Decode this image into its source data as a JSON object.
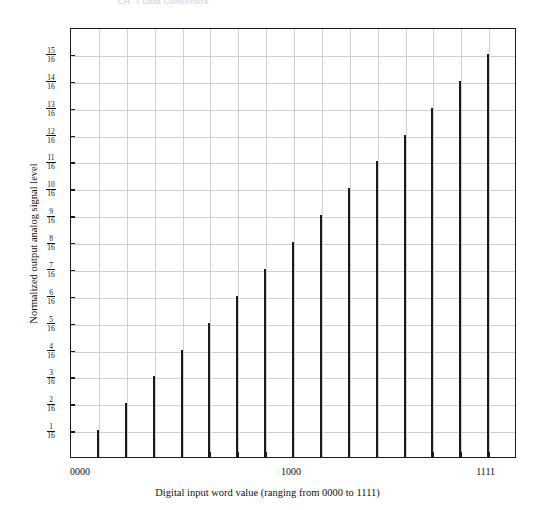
{
  "page": {
    "running_header": "CH.  7  Data Converters"
  },
  "chart_data": {
    "type": "bar",
    "title": "",
    "xlabel": "Digital input word value (ranging from 0000 to 1111)",
    "ylabel": "Normalized output analog signal level",
    "categories": [
      "0001",
      "0010",
      "0011",
      "0100",
      "0101",
      "0110",
      "0111",
      "1000",
      "1001",
      "1010",
      "1011",
      "1100",
      "1101",
      "1110",
      "1111"
    ],
    "values": [
      1,
      2,
      3,
      4,
      5,
      6,
      7,
      8,
      9,
      10,
      11,
      12,
      13,
      14,
      15
    ],
    "value_labels": [
      "1/16",
      "2/16",
      "3/16",
      "4/16",
      "5/16",
      "6/16",
      "7/16",
      "8/16",
      "9/16",
      "10/16",
      "11/16",
      "12/16",
      "13/16",
      "14/16",
      "15/16"
    ],
    "ylim": [
      0,
      16
    ],
    "ytick_values": [
      1,
      2,
      3,
      4,
      5,
      6,
      7,
      8,
      9,
      10,
      11,
      12,
      13,
      14,
      15
    ],
    "ytick_labels": [
      {
        "num": "1",
        "den": "16"
      },
      {
        "num": "2",
        "den": "16"
      },
      {
        "num": "3",
        "den": "16"
      },
      {
        "num": "4",
        "den": "16"
      },
      {
        "num": "5",
        "den": "16"
      },
      {
        "num": "6",
        "den": "16"
      },
      {
        "num": "7",
        "den": "16"
      },
      {
        "num": "8",
        "den": "16"
      },
      {
        "num": "9",
        "den": "16"
      },
      {
        "num": "10",
        "den": "16"
      },
      {
        "num": "11",
        "den": "16"
      },
      {
        "num": "12",
        "den": "16"
      },
      {
        "num": "13",
        "den": "16"
      },
      {
        "num": "14",
        "den": "16"
      },
      {
        "num": "15",
        "den": "16"
      }
    ],
    "xtick_labels": [
      {
        "label": "0000",
        "index": 0
      },
      {
        "label": "1000",
        "index": 8
      },
      {
        "label": "1111",
        "index": 15
      }
    ],
    "grid": true,
    "legend": null,
    "bar_color": "#1a1a1a",
    "grid_color": "#cfcfcf",
    "axis_color": "#1a1a1a"
  }
}
